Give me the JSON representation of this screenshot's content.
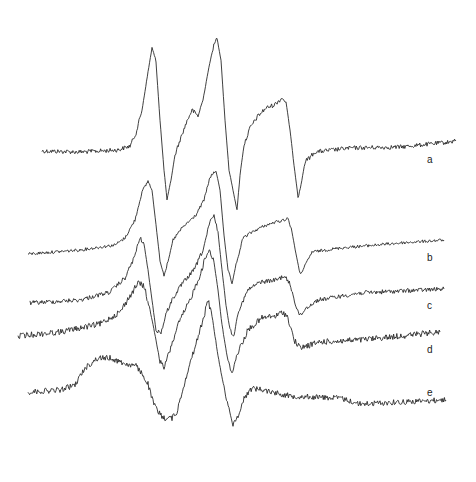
{
  "chart_data": {
    "type": "line",
    "title": "",
    "xlabel": "",
    "ylabel": "",
    "grid": false,
    "legend": "inline labels at right",
    "note": "Stacked EPR-like derivative spectra; coordinates are in image pixel space (x right, y down).",
    "series": [
      {
        "name": "a",
        "label_pos": [
          427,
          161
        ],
        "noise": 2.2,
        "points": [
          [
            42,
            151
          ],
          [
            80,
            152
          ],
          [
            118,
            150
          ],
          [
            130,
            146
          ],
          [
            136,
            133
          ],
          [
            142,
            110
          ],
          [
            148,
            72
          ],
          [
            152,
            48
          ],
          [
            156,
            62
          ],
          [
            160,
            120
          ],
          [
            164,
            170
          ],
          [
            167,
            200
          ],
          [
            171,
            180
          ],
          [
            175,
            155
          ],
          [
            180,
            140
          ],
          [
            187,
            121
          ],
          [
            192,
            110
          ],
          [
            198,
            116
          ],
          [
            203,
            100
          ],
          [
            208,
            72
          ],
          [
            213,
            48
          ],
          [
            217,
            38
          ],
          [
            221,
            60
          ],
          [
            225,
            120
          ],
          [
            229,
            170
          ],
          [
            233,
            190
          ],
          [
            237,
            210
          ],
          [
            240,
            175
          ],
          [
            244,
            145
          ],
          [
            250,
            128
          ],
          [
            258,
            116
          ],
          [
            266,
            108
          ],
          [
            274,
            105
          ],
          [
            282,
            98
          ],
          [
            286,
            102
          ],
          [
            290,
            130
          ],
          [
            294,
            165
          ],
          [
            298,
            196
          ],
          [
            301,
            185
          ],
          [
            305,
            162
          ],
          [
            315,
            152
          ],
          [
            350,
            148
          ],
          [
            400,
            147
          ],
          [
            450,
            142
          ],
          [
            456,
            140
          ]
        ]
      },
      {
        "name": "b",
        "label_pos": [
          427,
          259
        ],
        "noise": 1.5,
        "points": [
          [
            28,
            254
          ],
          [
            80,
            250
          ],
          [
            115,
            245
          ],
          [
            125,
            238
          ],
          [
            135,
            220
          ],
          [
            142,
            192
          ],
          [
            148,
            181
          ],
          [
            152,
            190
          ],
          [
            156,
            225
          ],
          [
            160,
            260
          ],
          [
            164,
            275
          ],
          [
            168,
            262
          ],
          [
            173,
            240
          ],
          [
            182,
            228
          ],
          [
            196,
            215
          ],
          [
            204,
            200
          ],
          [
            210,
            177
          ],
          [
            216,
            171
          ],
          [
            220,
            190
          ],
          [
            224,
            235
          ],
          [
            228,
            270
          ],
          [
            232,
            284
          ],
          [
            236,
            265
          ],
          [
            243,
            238
          ],
          [
            252,
            232
          ],
          [
            264,
            226
          ],
          [
            276,
            222
          ],
          [
            284,
            220
          ],
          [
            288,
            218
          ],
          [
            292,
            232
          ],
          [
            296,
            254
          ],
          [
            300,
            274
          ],
          [
            304,
            268
          ],
          [
            312,
            252
          ],
          [
            340,
            248
          ],
          [
            400,
            243
          ],
          [
            444,
            240
          ]
        ]
      },
      {
        "name": "c",
        "label_pos": [
          427,
          307
        ],
        "noise": 2.2,
        "points": [
          [
            30,
            303
          ],
          [
            80,
            300
          ],
          [
            110,
            292
          ],
          [
            125,
            278
          ],
          [
            134,
            258
          ],
          [
            140,
            238
          ],
          [
            144,
            244
          ],
          [
            148,
            270
          ],
          [
            152,
            300
          ],
          [
            156,
            330
          ],
          [
            161,
            333
          ],
          [
            166,
            314
          ],
          [
            172,
            300
          ],
          [
            182,
            284
          ],
          [
            194,
            270
          ],
          [
            203,
            250
          ],
          [
            210,
            222
          ],
          [
            214,
            216
          ],
          [
            218,
            232
          ],
          [
            222,
            270
          ],
          [
            226,
            305
          ],
          [
            230,
            330
          ],
          [
            234,
            336
          ],
          [
            238,
            312
          ],
          [
            248,
            290
          ],
          [
            260,
            282
          ],
          [
            276,
            280
          ],
          [
            284,
            276
          ],
          [
            290,
            284
          ],
          [
            296,
            306
          ],
          [
            300,
            316
          ],
          [
            306,
            308
          ],
          [
            318,
            300
          ],
          [
            360,
            293
          ],
          [
            400,
            291
          ],
          [
            444,
            289
          ]
        ]
      },
      {
        "name": "d",
        "label_pos": [
          427,
          351
        ],
        "noise": 3.0,
        "points": [
          [
            18,
            336
          ],
          [
            60,
            332
          ],
          [
            100,
            324
          ],
          [
            120,
            312
          ],
          [
            130,
            296
          ],
          [
            138,
            283
          ],
          [
            144,
            286
          ],
          [
            150,
            310
          ],
          [
            156,
            340
          ],
          [
            160,
            362
          ],
          [
            164,
            368
          ],
          [
            170,
            350
          ],
          [
            178,
            325
          ],
          [
            190,
            300
          ],
          [
            200,
            275
          ],
          [
            206,
            256
          ],
          [
            210,
            250
          ],
          [
            214,
            262
          ],
          [
            218,
            290
          ],
          [
            222,
            325
          ],
          [
            228,
            362
          ],
          [
            232,
            372
          ],
          [
            238,
            352
          ],
          [
            248,
            330
          ],
          [
            262,
            318
          ],
          [
            276,
            316
          ],
          [
            283,
            312
          ],
          [
            288,
            318
          ],
          [
            294,
            340
          ],
          [
            300,
            348
          ],
          [
            320,
            342
          ],
          [
            360,
            340
          ],
          [
            400,
            336
          ],
          [
            440,
            332
          ]
        ]
      },
      {
        "name": "e",
        "label_pos": [
          427,
          394
        ],
        "noise": 2.8,
        "points": [
          [
            28,
            392
          ],
          [
            60,
            390
          ],
          [
            75,
            385
          ],
          [
            85,
            368
          ],
          [
            98,
            358
          ],
          [
            110,
            358
          ],
          [
            126,
            364
          ],
          [
            136,
            366
          ],
          [
            142,
            374
          ],
          [
            148,
            384
          ],
          [
            153,
            402
          ],
          [
            158,
            412
          ],
          [
            164,
            418
          ],
          [
            172,
            418
          ],
          [
            177,
            412
          ],
          [
            181,
            396
          ],
          [
            188,
            370
          ],
          [
            196,
            344
          ],
          [
            204,
            316
          ],
          [
            208,
            300
          ],
          [
            212,
            316
          ],
          [
            218,
            356
          ],
          [
            224,
            388
          ],
          [
            229,
            408
          ],
          [
            233,
            426
          ],
          [
            238,
            416
          ],
          [
            244,
            398
          ],
          [
            252,
            388
          ],
          [
            264,
            390
          ],
          [
            290,
            396
          ],
          [
            340,
            398
          ],
          [
            360,
            404
          ],
          [
            400,
            402
          ],
          [
            446,
            400
          ]
        ]
      }
    ]
  }
}
